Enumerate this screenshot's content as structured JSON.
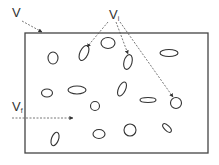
{
  "diagram": {
    "labels": {
      "total_volume": {
        "main": "V",
        "sub": ""
      },
      "inclusion_volume": {
        "main": "V",
        "sub": "i"
      },
      "matrix_volume": {
        "main": "V",
        "sub": "f"
      }
    },
    "box": {
      "x": 25,
      "y": 33,
      "width": 183,
      "height": 120
    },
    "inclusions": [
      {
        "cx": 53,
        "cy": 58,
        "rx": 5,
        "ry": 6,
        "rot": 0
      },
      {
        "cx": 84,
        "cy": 53,
        "rx": 4,
        "ry": 8,
        "rot": 25
      },
      {
        "cx": 108,
        "cy": 43,
        "rx": 7,
        "ry": 5.5,
        "rot": 0
      },
      {
        "cx": 128,
        "cy": 62,
        "rx": 4,
        "ry": 7.5,
        "rot": 15
      },
      {
        "cx": 169,
        "cy": 53,
        "rx": 9,
        "ry": 3.5,
        "rot": 0
      },
      {
        "cx": 47,
        "cy": 93,
        "rx": 5.5,
        "ry": 4,
        "rot": 0
      },
      {
        "cx": 77,
        "cy": 90,
        "rx": 9,
        "ry": 4,
        "rot": 0
      },
      {
        "cx": 95,
        "cy": 106,
        "rx": 4.5,
        "ry": 4.5,
        "rot": 0
      },
      {
        "cx": 122,
        "cy": 89,
        "rx": 3.5,
        "ry": 7.5,
        "rot": 25
      },
      {
        "cx": 148,
        "cy": 100,
        "rx": 8,
        "ry": 2.5,
        "rot": 0
      },
      {
        "cx": 176,
        "cy": 103,
        "rx": 5.5,
        "ry": 5.5,
        "rot": 0
      },
      {
        "cx": 55,
        "cy": 139,
        "rx": 3.5,
        "ry": 7,
        "rot": 20
      },
      {
        "cx": 99,
        "cy": 134,
        "rx": 6,
        "ry": 4.5,
        "rot": 0
      },
      {
        "cx": 130,
        "cy": 130,
        "rx": 6,
        "ry": 6,
        "rot": 0
      },
      {
        "cx": 167,
        "cy": 128,
        "rx": 2.5,
        "ry": 5.5,
        "rot": -45
      }
    ],
    "colors": {
      "stroke": "#333333",
      "background": "#ffffff"
    }
  }
}
